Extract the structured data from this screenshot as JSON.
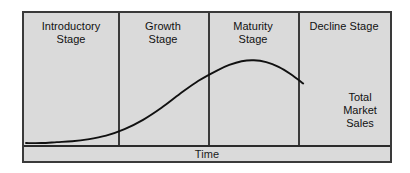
{
  "figure": {
    "axis": {
      "x_label": "Time",
      "y_label": ""
    },
    "stages": [
      {
        "id": "introductory",
        "line1": "Introductory",
        "line2": "Stage"
      },
      {
        "id": "growth",
        "line1": "Growth",
        "line2": "Stage"
      },
      {
        "id": "maturity",
        "line1": "Maturity",
        "line2": "Stage"
      },
      {
        "id": "decline",
        "line1": "Decline Stage",
        "line2": ""
      }
    ],
    "curve_annotation": {
      "line1": "Total",
      "line2": "Market",
      "line3": "Sales"
    },
    "colors": {
      "panel_fill": "#dadada",
      "frame_stroke": "#3a3a3a",
      "curve_stroke": "#111111",
      "text": "#111111",
      "page_background": "#ffffff"
    }
  },
  "chart_data": {
    "type": "line",
    "xlabel": "Time",
    "ylabel": "",
    "grid": false,
    "legend": null,
    "xlim": [
      0,
      100
    ],
    "ylim": [
      0,
      100
    ],
    "series": [
      {
        "name": "Total Market Sales",
        "x": [
          0,
          5,
          10,
          15,
          20,
          26,
          32,
          38,
          44,
          50,
          56,
          62,
          66,
          70,
          74,
          78,
          82,
          86,
          90
        ],
        "values": [
          1,
          1,
          2,
          3,
          5,
          9,
          16,
          26,
          39,
          54,
          68,
          79,
          85,
          89,
          90,
          88,
          83,
          75,
          65
        ]
      }
    ],
    "annotations": [
      {
        "text": "Total Market Sales",
        "x": 86,
        "y": 52,
        "points_to": [
          80,
          74
        ]
      }
    ],
    "regions": [
      {
        "label": "Introductory Stage",
        "x_start": 0,
        "x_end": 25
      },
      {
        "label": "Growth Stage",
        "x_start": 25,
        "x_end": 50
      },
      {
        "label": "Maturity Stage",
        "x_start": 50,
        "x_end": 75
      },
      {
        "label": "Decline Stage",
        "x_start": 75,
        "x_end": 100
      }
    ]
  }
}
